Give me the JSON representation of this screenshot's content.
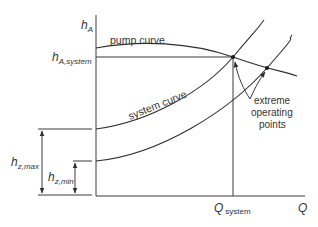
{
  "diagram": {
    "axes": {
      "y_label": "h",
      "y_label_sub": "A",
      "x_label": "Q"
    },
    "labels": {
      "h_system_main": "h",
      "h_system_sub": "A,system",
      "q_system_main": "Q",
      "q_system_sub": "system",
      "pump_curve": "pump curve",
      "system_curve": "system curve",
      "extreme_line1": "extreme",
      "extreme_line2": "operating",
      "extreme_line3": "points",
      "hz_max_main": "h",
      "hz_max_sub": "z,max",
      "hz_min_main": "h",
      "hz_min_sub": "z,min"
    },
    "colors": {
      "line": "#3a3a3a",
      "text": "#333333",
      "background": "#ffffff"
    }
  }
}
